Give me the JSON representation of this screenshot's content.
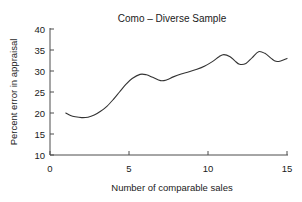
{
  "figure": {
    "width": 302,
    "height": 202,
    "background": "#ffffff",
    "line_color": "#333333",
    "axis_color": "#4d4d4d",
    "text_color": "#1a1a1a"
  },
  "chart_data": {
    "type": "line",
    "title": "Como – Diverse Sample",
    "xlabel": "Number of comparable sales",
    "ylabel": "Percent error in appraisal",
    "xlim": [
      0,
      15
    ],
    "ylim": [
      10,
      40
    ],
    "xticks": [
      0,
      5,
      10,
      15
    ],
    "xtick_labels": [
      "0",
      "5",
      "10",
      "15"
    ],
    "yticks": [
      10,
      15,
      20,
      25,
      30,
      35,
      40
    ],
    "ytick_labels": [
      "10",
      "15",
      "20",
      "25",
      "30",
      "35",
      "40"
    ],
    "grid": false,
    "legend": false,
    "series": [
      {
        "name": "Como diverse sample",
        "x": [
          1.0,
          1.3,
          1.6,
          2.0,
          2.4,
          2.8,
          3.2,
          3.6,
          4.0,
          4.4,
          4.8,
          5.2,
          5.7,
          6.1,
          6.5,
          7.0,
          7.4,
          7.8,
          8.3,
          8.8,
          9.3,
          9.8,
          10.3,
          10.7,
          11.0,
          11.4,
          11.7,
          12.0,
          12.4,
          12.8,
          13.2,
          13.6,
          14.0,
          14.3,
          14.6,
          15.0
        ],
        "y": [
          20.0,
          19.4,
          19.1,
          18.9,
          19.0,
          19.5,
          20.4,
          21.6,
          23.2,
          25.0,
          26.8,
          28.2,
          29.2,
          29.1,
          28.5,
          27.7,
          27.9,
          28.6,
          29.3,
          29.8,
          30.4,
          31.2,
          32.3,
          33.4,
          33.9,
          33.4,
          32.4,
          31.6,
          31.8,
          33.2,
          34.6,
          34.2,
          33.0,
          32.3,
          32.4,
          33.0
        ]
      }
    ]
  }
}
